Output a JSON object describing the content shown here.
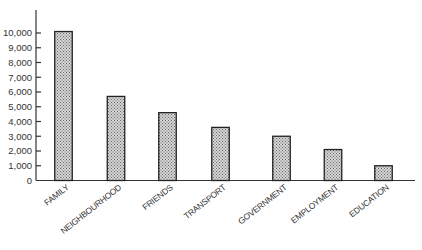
{
  "chart_data": {
    "type": "bar",
    "title": "",
    "xlabel": "",
    "ylabel": "",
    "categories": [
      "FAMILY",
      "NEIGHBOURHOOD",
      "FRIENDS",
      "TRANSPORT",
      "GOVERNMENT",
      "EMPLOYMENT",
      "EDUCATION"
    ],
    "values": [
      10100,
      5700,
      4600,
      3600,
      3000,
      2100,
      1000
    ],
    "ylim": [
      0,
      11000
    ],
    "yticks": [
      0,
      1000,
      2000,
      3000,
      4000,
      5000,
      6000,
      7000,
      8000,
      9000,
      10000
    ],
    "ytick_labels": [
      "0",
      "1,000",
      "2,000",
      "3,000",
      "4,000",
      "5,000",
      "6,000",
      "7,000",
      "8,000",
      "9,000",
      "10,000"
    ],
    "grid": false,
    "legend": null,
    "bar_fill": "#b8b8b8",
    "bar_stroke": "#222222"
  }
}
